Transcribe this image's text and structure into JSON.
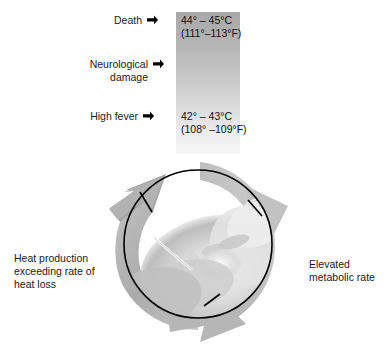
{
  "figure": {
    "colors": {
      "bar_top": "#a9a9a9",
      "bar_bottom": "#f7f7f7",
      "ring": "#b4b4b4",
      "ring_shade": "#9a9a9a",
      "outline": "#000000",
      "text": "#1b1b1b"
    }
  },
  "scale": {
    "rows": [
      {
        "label": "Death",
        "marker": "arrowhead-right-icon",
        "celsius": "44° – 45°C",
        "fahrenheit": "(111°–113°F)"
      },
      {
        "label_line1": "Neurological",
        "label_line2": "damage",
        "marker": "arrowhead-right-icon",
        "celsius": "",
        "fahrenheit": ""
      },
      {
        "label": "High fever",
        "marker": "arrowhead-right-icon",
        "celsius": "42° – 43°C",
        "fahrenheit": "(108° –109°F)"
      }
    ]
  },
  "cycle": {
    "caption_left": {
      "line1": "Heat production",
      "line2": "exceeding rate of",
      "line3": "heat loss"
    },
    "caption_right": {
      "line1": "Elevated",
      "line2": "metabolic rate"
    },
    "photo_alt": "person-face-photo",
    "arrow_count": "3"
  }
}
